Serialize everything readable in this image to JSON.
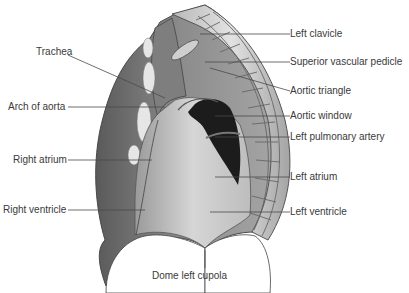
{
  "figure": {
    "labels_left": [
      {
        "id": "trachea",
        "text": "Trachea"
      },
      {
        "id": "arch-of-aorta",
        "text": "Arch of aorta"
      },
      {
        "id": "right-atrium",
        "text": "Right atrium"
      },
      {
        "id": "right-ventricle",
        "text": "Right ventricle"
      }
    ],
    "labels_right": [
      {
        "id": "left-clavicle",
        "text": "Left clavicle"
      },
      {
        "id": "superior-vascular-pedicle",
        "text": "Superior vascular pedicle"
      },
      {
        "id": "aortic-triangle",
        "text": "Aortic triangle"
      },
      {
        "id": "aortic-window",
        "text": "Aortic window"
      },
      {
        "id": "left-pulmonary-artery",
        "text": "Left pulmonary artery"
      },
      {
        "id": "left-atrium",
        "text": "Left atrium"
      },
      {
        "id": "left-ventricle",
        "text": "Left ventricle"
      }
    ],
    "labels_bottom": [
      {
        "id": "dome-left-cupola",
        "text": "Dome left cupola"
      }
    ],
    "colors": {
      "leader_line": "#4a4a4a",
      "label_text": "#3a3a3a",
      "dark_window": "#1a1a1a",
      "outline": "#444444"
    }
  }
}
